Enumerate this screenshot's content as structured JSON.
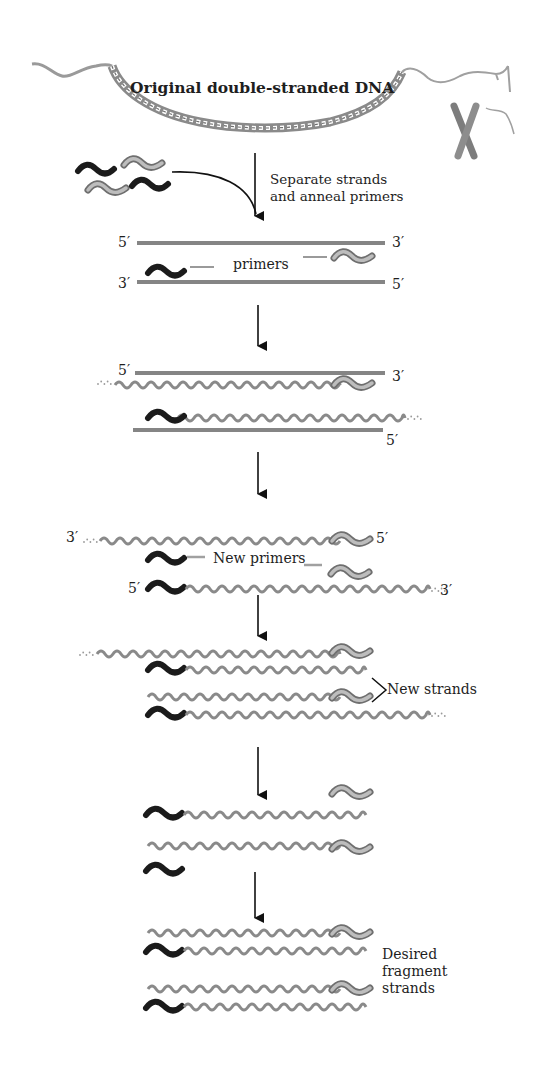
{
  "title": "Original double-stranded DNA",
  "steps": [
    {
      "id": "original",
      "label": "Original double-stranded DNA"
    },
    {
      "id": "separate",
      "label": "Separate strands\nand anneal primers"
    },
    {
      "id": "anneal",
      "label": "primers",
      "ends": {
        "top_left": "5′",
        "top_right": "3′",
        "bottom_left": "3′",
        "bottom_right": "5′"
      }
    },
    {
      "id": "extend",
      "ends": {
        "top_left": "5′",
        "top_right": "3′",
        "bottom_right": "5′"
      }
    },
    {
      "id": "second_cycle",
      "label": "New primers",
      "ends": {
        "top_left": "3′",
        "top_right": "5′",
        "bottom_left": "5′",
        "bottom_right": "3′"
      }
    },
    {
      "id": "new_strands",
      "label": "New strands"
    },
    {
      "id": "separated_short"
    },
    {
      "id": "desired",
      "label": "Desired\nfragment\nstrands"
    }
  ],
  "labels": {
    "original": "Original double-stranded DNA",
    "separate": "Separate strands\nand anneal primers",
    "primers": "primers",
    "new_primers": "New primers",
    "new_strands": "New strands",
    "desired": "Desired\nfragment\nstrands",
    "five_prime": "5′",
    "three_prime": "3′"
  },
  "colors": {
    "strand": "#8a8a8a",
    "strand_dark": "#6f6f6f",
    "primer_black": "#1b1b1b",
    "primer_gray": "#9a9a9a",
    "arrow": "#111111",
    "background": "#ffffff"
  }
}
